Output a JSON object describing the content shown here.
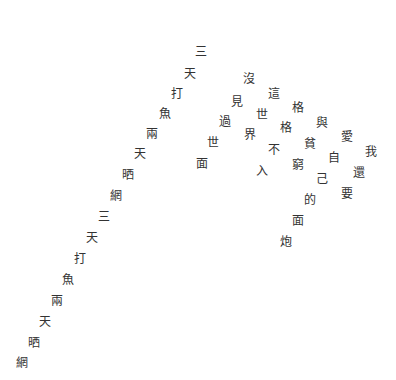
{
  "text_color": "#333333",
  "background": "#ffffff",
  "lines": [
    {
      "name": "line-1",
      "chars": [
        {
          "c": "三",
          "x": 194,
          "y": 45
        },
        {
          "c": "天",
          "x": 183,
          "y": 67
        },
        {
          "c": "打",
          "x": 170,
          "y": 87
        },
        {
          "c": "魚",
          "x": 158,
          "y": 107
        },
        {
          "c": "兩",
          "x": 145,
          "y": 127
        },
        {
          "c": "天",
          "x": 133,
          "y": 147
        },
        {
          "c": "晒",
          "x": 121,
          "y": 168
        },
        {
          "c": "網",
          "x": 109,
          "y": 189
        },
        {
          "c": "三",
          "x": 97,
          "y": 210
        },
        {
          "c": "天",
          "x": 85,
          "y": 231
        },
        {
          "c": "打",
          "x": 73,
          "y": 252
        },
        {
          "c": "魚",
          "x": 61,
          "y": 273
        },
        {
          "c": "兩",
          "x": 50,
          "y": 294
        },
        {
          "c": "天",
          "x": 38,
          "y": 315
        },
        {
          "c": "晒",
          "x": 27,
          "y": 336
        },
        {
          "c": "網",
          "x": 15,
          "y": 356
        }
      ]
    },
    {
      "name": "line-2",
      "chars": [
        {
          "c": "沒",
          "x": 242,
          "y": 72
        },
        {
          "c": "見",
          "x": 230,
          "y": 95
        },
        {
          "c": "過",
          "x": 218,
          "y": 115
        },
        {
          "c": "世",
          "x": 206,
          "y": 136
        },
        {
          "c": "面",
          "x": 195,
          "y": 157
        }
      ]
    },
    {
      "name": "line-3",
      "chars": [
        {
          "c": "這",
          "x": 267,
          "y": 87
        },
        {
          "c": "世",
          "x": 255,
          "y": 108
        },
        {
          "c": "界",
          "x": 243,
          "y": 128
        }
      ]
    },
    {
      "name": "line-4",
      "chars": [
        {
          "c": "格",
          "x": 291,
          "y": 101
        },
        {
          "c": "格",
          "x": 279,
          "y": 121
        },
        {
          "c": "不",
          "x": 267,
          "y": 143
        },
        {
          "c": "入",
          "x": 255,
          "y": 164
        }
      ]
    },
    {
      "name": "line-5",
      "chars": [
        {
          "c": "與",
          "x": 315,
          "y": 116
        },
        {
          "c": "貧",
          "x": 303,
          "y": 137
        },
        {
          "c": "窮",
          "x": 291,
          "y": 158
        }
      ]
    },
    {
      "name": "line-6",
      "chars": [
        {
          "c": "愛",
          "x": 340,
          "y": 130
        },
        {
          "c": "自",
          "x": 327,
          "y": 151
        },
        {
          "c": "己",
          "x": 315,
          "y": 172
        },
        {
          "c": "的",
          "x": 303,
          "y": 193
        },
        {
          "c": "面",
          "x": 291,
          "y": 214
        },
        {
          "c": "炮",
          "x": 279,
          "y": 235
        }
      ]
    },
    {
      "name": "line-7",
      "chars": [
        {
          "c": "我",
          "x": 364,
          "y": 145
        },
        {
          "c": "還",
          "x": 352,
          "y": 166
        },
        {
          "c": "要",
          "x": 340,
          "y": 187
        }
      ]
    }
  ]
}
